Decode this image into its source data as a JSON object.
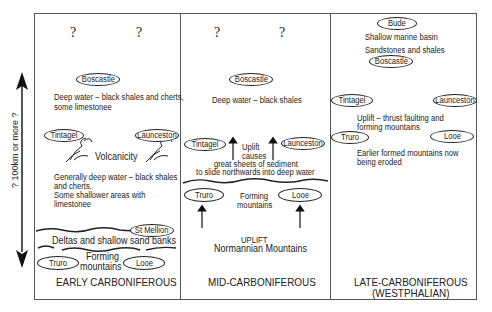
{
  "side_scale": {
    "label": "? 100km or more ?"
  },
  "panels": {
    "early": {
      "title": "EARLY CARBONIFEROUS",
      "question_marks": [
        "?",
        "?"
      ],
      "places": {
        "boscastle": "Boscastle",
        "tintagel": "Tintagel",
        "launceston": "Launceston",
        "st_mellion": "St Mellion",
        "truro": "Truro",
        "looe": "Looe"
      },
      "deep_water_1": "Deep water – black shales and cherts,",
      "deep_water_2": "some limestonee",
      "volcanicity": "Volcanicity",
      "general_1": "Generally deep water – black shales",
      "general_2": "and cherts.",
      "general_3": "Some shallower areas with",
      "general_4": "limestonee",
      "deltas": "Deltas and shallow sand banks",
      "forming_1": "Forming",
      "forming_2": "mountains"
    },
    "mid": {
      "title": "MID-CARBONIFEROUS",
      "question_marks": [
        "?",
        "?"
      ],
      "places": {
        "boscastle": "Boscastle",
        "tintagel": "Tintagel",
        "launceston": "Launceston",
        "truro": "Truro",
        "looe": "Looe"
      },
      "deep_water": "Deep water – black shales",
      "uplift": "Uplift",
      "causes": "causes",
      "sheets_1": "great sheets of sediment",
      "sheets_2": "to slide northwards into deep water",
      "forming_1": "Forming",
      "forming_2": "mountains",
      "uplift_caps": "UPLIFT",
      "normannian": "Normannian Mountains"
    },
    "late": {
      "title": "LATE-CARBONIFEROUS",
      "subtitle": "(WESTPHALIAN)",
      "places": {
        "bude": "Bude",
        "boscastle": "Boscastle",
        "tintagel": "Tintagel",
        "launceston": "Launceston",
        "truro": "Truro",
        "looe": "Looe"
      },
      "shallow": "Shallow marine basin",
      "sandstones": "Sandstones and shales",
      "uplift_1": "Uplift – thrust faulting and",
      "uplift_2": "forming mountains",
      "eroded_1": "Earlier formed mountains now",
      "eroded_2": "being eroded"
    }
  }
}
